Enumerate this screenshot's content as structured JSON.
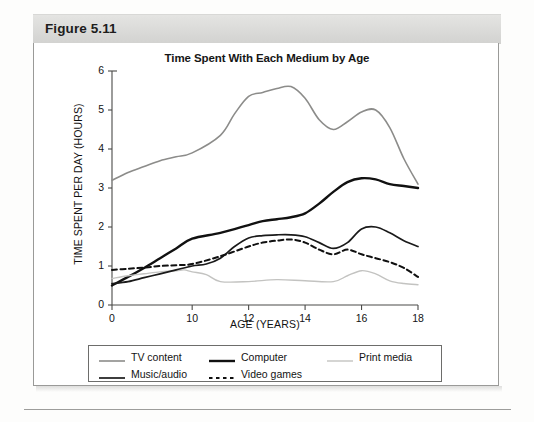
{
  "figure": {
    "header_label": "Figure 5.11"
  },
  "chart_data": {
    "type": "line",
    "title": "Time Spent With Each Medium by Age",
    "xlabel": "AGE (YEARS)",
    "ylabel": "TIME SPENT PER DAY (HOURS)",
    "xlim": [
      0,
      18
    ],
    "ylim": [
      0,
      6
    ],
    "xticks": [
      0,
      10,
      12,
      14,
      16,
      18
    ],
    "xtick_labels": [
      "0",
      "10",
      "12",
      "14",
      "16",
      "18"
    ],
    "yticks": [
      0,
      1,
      2,
      3,
      4,
      5,
      6
    ],
    "ytick_labels": [
      "0",
      "1",
      "2",
      "3",
      "4",
      "5",
      "6"
    ],
    "grid": false,
    "legend_position": "below",
    "note": "x-axis uses a non-linear (compressed 0-10) scale",
    "series": [
      {
        "name": "TV content",
        "color": "#8c8c8a",
        "width": 1.6,
        "dash": "none",
        "x": [
          0,
          2,
          4,
          6,
          8,
          10,
          11,
          11.5,
          12,
          12.5,
          13,
          13.5,
          14,
          14.5,
          15,
          15.5,
          16,
          16.5,
          17,
          17.5,
          18
        ],
        "y": [
          3.2,
          3.4,
          3.55,
          3.7,
          3.8,
          3.9,
          4.35,
          4.9,
          5.35,
          5.45,
          5.55,
          5.6,
          5.3,
          4.75,
          4.5,
          4.7,
          4.95,
          5.0,
          4.55,
          3.75,
          3.1
        ]
      },
      {
        "name": "Computer",
        "color": "#111111",
        "width": 2.4,
        "dash": "none",
        "x": [
          0,
          2,
          4,
          6,
          8,
          10,
          11,
          12,
          12.5,
          13,
          13.5,
          14,
          14.5,
          15,
          15.5,
          16,
          16.5,
          17,
          17.5,
          18
        ],
        "y": [
          0.5,
          0.72,
          0.95,
          1.2,
          1.45,
          1.7,
          1.85,
          2.05,
          2.15,
          2.2,
          2.25,
          2.35,
          2.6,
          2.9,
          3.15,
          3.25,
          3.22,
          3.1,
          3.05,
          3.0
        ]
      },
      {
        "name": "Print media",
        "color": "#c3c3c1",
        "width": 1.4,
        "dash": "none",
        "x": [
          0,
          2,
          4,
          6,
          8,
          9,
          10,
          10.5,
          11,
          12,
          13,
          14,
          15,
          15.5,
          16,
          16.5,
          17,
          17.5,
          18
        ],
        "y": [
          0.68,
          0.75,
          0.8,
          0.85,
          0.88,
          0.9,
          0.85,
          0.78,
          0.6,
          0.6,
          0.65,
          0.62,
          0.6,
          0.75,
          0.88,
          0.8,
          0.62,
          0.55,
          0.52
        ]
      },
      {
        "name": "Music/audio",
        "color": "#1a1a1a",
        "width": 1.7,
        "dash": "none",
        "x": [
          0,
          2,
          4,
          6,
          8,
          10,
          10.5,
          11,
          11.5,
          12,
          12.5,
          13,
          13.5,
          14,
          14.5,
          15,
          15.5,
          16,
          16.5,
          17,
          17.5,
          18
        ],
        "y": [
          0.55,
          0.6,
          0.7,
          0.8,
          0.9,
          1.0,
          1.05,
          1.2,
          1.5,
          1.72,
          1.78,
          1.8,
          1.8,
          1.75,
          1.6,
          1.45,
          1.6,
          1.95,
          2.0,
          1.85,
          1.65,
          1.5
        ]
      },
      {
        "name": "Video games",
        "color": "#101010",
        "width": 2.0,
        "dash": "5,3.5",
        "x": [
          0,
          2,
          4,
          6,
          8,
          10,
          11,
          12,
          12.5,
          13,
          13.5,
          14,
          14.5,
          15,
          15.5,
          16,
          16.5,
          17,
          17.5,
          18
        ],
        "y": [
          0.9,
          0.93,
          0.96,
          1.0,
          1.02,
          1.05,
          1.25,
          1.5,
          1.6,
          1.65,
          1.68,
          1.6,
          1.42,
          1.3,
          1.42,
          1.3,
          1.2,
          1.1,
          0.95,
          0.72
        ]
      }
    ]
  },
  "legend": {
    "rows": [
      [
        {
          "label": "TV content",
          "icon": "line-swatch-gray"
        },
        {
          "label": "Computer",
          "icon": "line-swatch-black-thick"
        },
        {
          "label": "Print media",
          "icon": "line-swatch-light-gray"
        }
      ],
      [
        {
          "label": "Music/audio",
          "icon": "line-swatch-black"
        },
        {
          "label": "Video games",
          "icon": "line-swatch-dashed"
        }
      ]
    ]
  }
}
